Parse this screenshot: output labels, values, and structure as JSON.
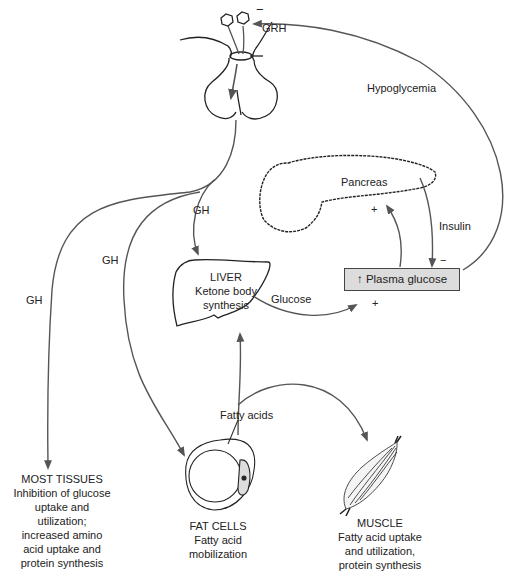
{
  "diagram": {
    "colors": {
      "line": "#333333",
      "arrow": "#555555",
      "box_fill": "#dcdcdc"
    },
    "signs": {
      "minus": "−",
      "plus": "+"
    },
    "hypothalamus": {
      "hormone": "GRH",
      "feedback_sign": "−"
    },
    "feedback": {
      "label": "Hypoglycemia"
    },
    "growth_hormone": {
      "label_tissues": "GH",
      "label_fat": "GH",
      "label_liver": "GH"
    },
    "pancreas": {
      "label": "Pancreas",
      "stim_sign": "+"
    },
    "insulin": {
      "label": "Insulin",
      "sign": "−"
    },
    "plasma_glucose": {
      "arrow": "↑",
      "label": "Plasma glucose",
      "input_sign": "+"
    },
    "liver": {
      "title": "LIVER",
      "line1": "Ketone body",
      "line2": "synthesis"
    },
    "glucose_flow": {
      "label": "Glucose"
    },
    "fatty_acids": {
      "label": "Fatty acids"
    },
    "most_tissues": {
      "title": "MOST TISSUES",
      "lines": [
        "Inhibition of glucose",
        "uptake and",
        "utilization;",
        "increased amino",
        "acid uptake and",
        "protein synthesis"
      ]
    },
    "fat_cells": {
      "title": "FAT CELLS",
      "lines": [
        "Fatty acid",
        "mobilization"
      ]
    },
    "muscle": {
      "title": "MUSCLE",
      "lines": [
        "Fatty acid uptake",
        "and utilization,",
        "protein synthesis"
      ]
    }
  }
}
